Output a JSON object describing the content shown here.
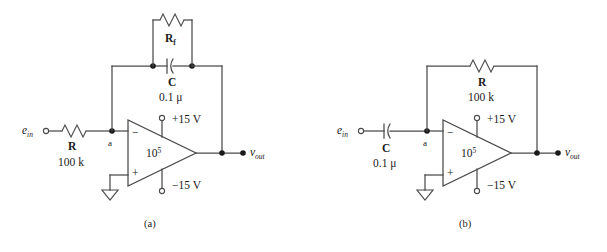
{
  "figure": {
    "type": "circuit-diagram",
    "background_color": "#ffffff",
    "line_color": "#4a4a4a",
    "text_color": "#1a1a1a"
  },
  "circuits": [
    {
      "id": "a",
      "caption": "(a)",
      "name": "lossy-integrator",
      "input_label": "e",
      "input_subscript": "in",
      "output_label": "v",
      "output_subscript": "out",
      "node_label": "a",
      "opamp": {
        "gain_base": "10",
        "gain_exponent": "5",
        "inverting_sign": "−",
        "noninverting_sign": "+",
        "supply_positive": "+15 V",
        "supply_negative": "−15 V"
      },
      "components": [
        {
          "name": "input-resistor",
          "symbol": "resistor",
          "label": "R",
          "subscript": "",
          "value": "100 k"
        },
        {
          "name": "feedback-resistor",
          "symbol": "resistor",
          "label": "R",
          "subscript": "f",
          "value": ""
        },
        {
          "name": "feedback-capacitor",
          "symbol": "capacitor",
          "label": "C",
          "subscript": "",
          "value": "0.1 μ"
        }
      ]
    },
    {
      "id": "b",
      "caption": "(b)",
      "name": "differentiator",
      "input_label": "e",
      "input_subscript": "in",
      "output_label": "v",
      "output_subscript": "out",
      "node_label": "a",
      "opamp": {
        "gain_base": "10",
        "gain_exponent": "5",
        "inverting_sign": "−",
        "noninverting_sign": "+",
        "supply_positive": "+15 V",
        "supply_negative": "−15 V"
      },
      "components": [
        {
          "name": "input-capacitor",
          "symbol": "capacitor",
          "label": "C",
          "subscript": "",
          "value": "0.1 μ"
        },
        {
          "name": "feedback-resistor",
          "symbol": "resistor",
          "label": "R",
          "subscript": "",
          "value": "100 k"
        }
      ]
    }
  ]
}
